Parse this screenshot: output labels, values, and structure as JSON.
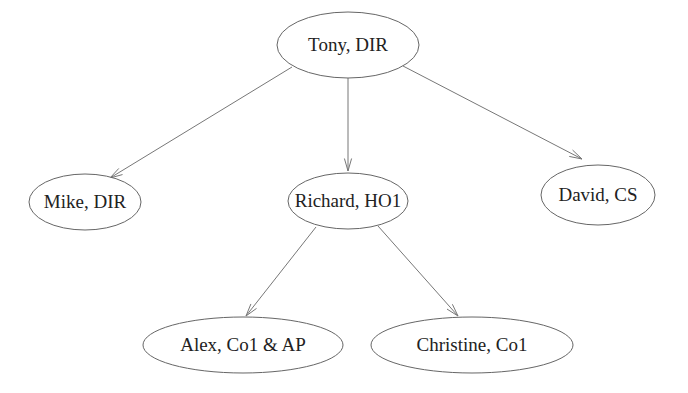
{
  "diagram": {
    "type": "tree",
    "nodes": [
      {
        "id": "tony",
        "label": "Tony, DIR",
        "cx": 348,
        "cy": 45,
        "rx": 71,
        "ry": 33
      },
      {
        "id": "mike",
        "label": "Mike, DIR",
        "cx": 85,
        "cy": 202,
        "rx": 56,
        "ry": 28
      },
      {
        "id": "richard",
        "label": "Richard, HO1",
        "cx": 348,
        "cy": 201,
        "rx": 60,
        "ry": 28
      },
      {
        "id": "david",
        "label": "David, CS",
        "cx": 598,
        "cy": 195,
        "rx": 57,
        "ry": 30
      },
      {
        "id": "alex",
        "label": "Alex, Co1 & AP",
        "cx": 243,
        "cy": 345,
        "rx": 100,
        "ry": 28
      },
      {
        "id": "christine",
        "label": "Christine, Co1",
        "cx": 472,
        "cy": 345,
        "rx": 101,
        "ry": 28
      }
    ],
    "edges": [
      {
        "from": "tony",
        "to": "mike",
        "x1": 292,
        "y1": 67,
        "x2": 110,
        "y2": 178
      },
      {
        "from": "tony",
        "to": "richard",
        "x1": 348,
        "y1": 78,
        "x2": 348,
        "y2": 171
      },
      {
        "from": "tony",
        "to": "david",
        "x1": 403,
        "y1": 66,
        "x2": 582,
        "y2": 159
      },
      {
        "from": "richard",
        "to": "alex",
        "x1": 316,
        "y1": 227,
        "x2": 246,
        "y2": 316
      },
      {
        "from": "richard",
        "to": "christine",
        "x1": 378,
        "y1": 226,
        "x2": 458,
        "y2": 316
      }
    ]
  }
}
